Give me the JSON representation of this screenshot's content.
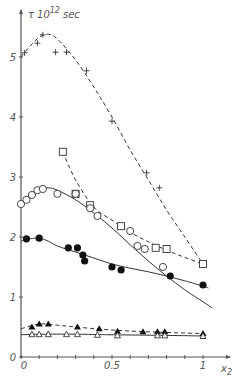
{
  "chart_data": {
    "type": "scatter",
    "title": "",
    "ylabel": "τ·10^12 sec",
    "ylabel_parts": {
      "symbol": "τ",
      "base": "10",
      "exp": "12",
      "unit": "sec"
    },
    "xlabel": "x2",
    "xlabel_parts": {
      "base": "x",
      "sub": "2"
    },
    "xlim": [
      0,
      1.1
    ],
    "ylim": [
      0,
      5.5
    ],
    "x_ticks": [
      0,
      0.1,
      0.2,
      0.3,
      0.4,
      0.5,
      0.6,
      0.7,
      0.8,
      0.9,
      1.0
    ],
    "x_tick_labels": [
      {
        "value": 0,
        "label": "0"
      },
      {
        "value": 0.5,
        "label": "0.5"
      },
      {
        "value": 1,
        "label": "1"
      }
    ],
    "y_ticks": [
      0,
      1,
      2,
      3,
      4,
      5
    ],
    "y_tick_labels": [
      "0",
      "1",
      "2",
      "3",
      "4",
      "5"
    ],
    "grid": false,
    "legend": null,
    "series": [
      {
        "name": "plus",
        "marker": "plus",
        "line": "dashed",
        "points": [
          [
            0.02,
            5.07
          ],
          [
            0.09,
            5.23
          ],
          [
            0.12,
            5.37
          ],
          [
            0.19,
            5.08
          ],
          [
            0.25,
            5.08
          ],
          [
            0.36,
            4.77
          ],
          [
            0.5,
            3.93
          ],
          [
            0.69,
            3.07
          ],
          [
            0.76,
            2.82
          ],
          [
            1.0,
            1.55
          ]
        ],
        "curve": [
          [
            0.0,
            5.0
          ],
          [
            0.05,
            5.18
          ],
          [
            0.1,
            5.33
          ],
          [
            0.15,
            5.38
          ],
          [
            0.2,
            5.3
          ],
          [
            0.3,
            4.95
          ],
          [
            0.4,
            4.5
          ],
          [
            0.5,
            4.0
          ],
          [
            0.6,
            3.45
          ],
          [
            0.7,
            2.95
          ],
          [
            0.8,
            2.45
          ],
          [
            0.9,
            2.0
          ],
          [
            1.0,
            1.55
          ]
        ]
      },
      {
        "name": "open-square",
        "marker": "square-open",
        "line": "dashed",
        "points": [
          [
            0.23,
            3.42
          ],
          [
            0.3,
            2.72
          ],
          [
            0.38,
            2.53
          ],
          [
            0.55,
            2.18
          ],
          [
            0.74,
            1.82
          ],
          [
            0.8,
            1.8
          ],
          [
            1.0,
            1.55
          ]
        ],
        "curve": [
          [
            0.23,
            3.42
          ],
          [
            0.3,
            2.95
          ],
          [
            0.4,
            2.5
          ],
          [
            0.5,
            2.28
          ],
          [
            0.6,
            2.08
          ],
          [
            0.7,
            1.92
          ],
          [
            0.8,
            1.78
          ],
          [
            0.9,
            1.66
          ],
          [
            1.0,
            1.55
          ]
        ]
      },
      {
        "name": "open-circle",
        "marker": "circle-open",
        "line": "solid",
        "points": [
          [
            0.0,
            2.55
          ],
          [
            0.03,
            2.62
          ],
          [
            0.06,
            2.7
          ],
          [
            0.09,
            2.78
          ],
          [
            0.12,
            2.8
          ],
          [
            0.2,
            2.72
          ],
          [
            0.3,
            2.72
          ],
          [
            0.38,
            2.48
          ],
          [
            0.42,
            2.35
          ],
          [
            0.6,
            2.1
          ],
          [
            0.64,
            1.85
          ],
          [
            0.68,
            1.8
          ],
          [
            0.78,
            1.5
          ]
        ],
        "curve": [
          [
            0.0,
            2.5
          ],
          [
            0.05,
            2.7
          ],
          [
            0.1,
            2.8
          ],
          [
            0.15,
            2.82
          ],
          [
            0.2,
            2.78
          ],
          [
            0.3,
            2.62
          ],
          [
            0.4,
            2.4
          ],
          [
            0.5,
            2.15
          ],
          [
            0.6,
            1.87
          ],
          [
            0.7,
            1.6
          ],
          [
            0.8,
            1.35
          ],
          [
            0.9,
            1.12
          ],
          [
            1.0,
            0.92
          ],
          [
            1.05,
            0.82
          ]
        ]
      },
      {
        "name": "filled-circle",
        "marker": "circle-filled",
        "line": "solid",
        "points": [
          [
            0.03,
            1.97
          ],
          [
            0.1,
            1.98
          ],
          [
            0.26,
            1.82
          ],
          [
            0.31,
            1.82
          ],
          [
            0.34,
            1.7
          ],
          [
            0.35,
            1.6
          ],
          [
            0.5,
            1.5
          ],
          [
            0.55,
            1.45
          ],
          [
            0.82,
            1.35
          ],
          [
            1.0,
            1.2
          ]
        ],
        "curve": [
          [
            0.0,
            1.93
          ],
          [
            0.05,
            1.97
          ],
          [
            0.1,
            1.98
          ],
          [
            0.15,
            1.93
          ],
          [
            0.2,
            1.85
          ],
          [
            0.3,
            1.75
          ],
          [
            0.4,
            1.65
          ],
          [
            0.5,
            1.55
          ],
          [
            0.6,
            1.48
          ],
          [
            0.7,
            1.42
          ],
          [
            0.8,
            1.35
          ],
          [
            0.9,
            1.27
          ],
          [
            1.0,
            1.18
          ],
          [
            1.03,
            1.15
          ]
        ]
      },
      {
        "name": "filled-triangle",
        "marker": "triangle-filled",
        "line": "dashed",
        "points": [
          [
            0.06,
            0.5
          ],
          [
            0.1,
            0.55
          ],
          [
            0.15,
            0.55
          ],
          [
            0.31,
            0.5
          ],
          [
            0.43,
            0.47
          ],
          [
            0.53,
            0.43
          ],
          [
            0.67,
            0.42
          ],
          [
            0.75,
            0.42
          ],
          [
            0.79,
            0.42
          ],
          [
            1.0,
            0.39
          ]
        ],
        "curve": [
          [
            0.0,
            0.47
          ],
          [
            0.1,
            0.55
          ],
          [
            0.2,
            0.53
          ],
          [
            0.3,
            0.5
          ],
          [
            0.5,
            0.45
          ],
          [
            0.7,
            0.42
          ],
          [
            1.0,
            0.39
          ]
        ]
      },
      {
        "name": "open-triangle",
        "marker": "triangle-open",
        "line": "solid",
        "points": [
          [
            0.06,
            0.38
          ],
          [
            0.1,
            0.38
          ],
          [
            0.15,
            0.38
          ],
          [
            0.25,
            0.38
          ],
          [
            0.31,
            0.38
          ],
          [
            0.42,
            0.37
          ],
          [
            0.53,
            0.36
          ],
          [
            0.75,
            0.36
          ],
          [
            0.79,
            0.36
          ],
          [
            1.0,
            0.35
          ]
        ],
        "curve": [
          [
            0.0,
            0.37
          ],
          [
            0.1,
            0.38
          ],
          [
            0.3,
            0.38
          ],
          [
            0.5,
            0.37
          ],
          [
            0.8,
            0.36
          ],
          [
            1.0,
            0.35
          ]
        ]
      }
    ]
  },
  "colors": {
    "ink": "#333333",
    "axis": "#555555",
    "background": "#ffffff"
  }
}
